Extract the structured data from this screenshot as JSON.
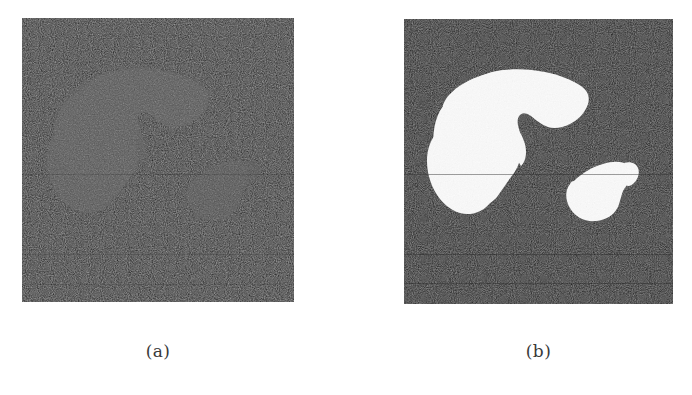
{
  "figure": {
    "background_color": "#ffffff",
    "panels": [
      {
        "id": "a",
        "caption": "(a)",
        "description": "CT abdominal slice with liver and spleen regions highlighted in mid-gray over a dark noisy background",
        "background_color": "#171717",
        "region_color": "#545454",
        "noise_intensity": "high",
        "regions": [
          {
            "name": "liver",
            "label": "liver-region",
            "fill": "#545454"
          },
          {
            "name": "spleen",
            "label": "spleen-region",
            "fill": "#4e4e4e"
          },
          {
            "name": "rib-sliver",
            "label": "rib-sliver-region",
            "fill": "#4a4a4a"
          }
        ]
      },
      {
        "id": "b",
        "caption": "(b)",
        "description": "Binary segmentation mask of the same slice: liver and spleen in white over black background",
        "background_color": "#0d0d0d",
        "region_color": "#fbfbfb",
        "noise_intensity": "high",
        "regions": [
          {
            "name": "liver",
            "label": "liver-region",
            "fill": "#fbfbfb"
          },
          {
            "name": "spleen",
            "label": "spleen-region",
            "fill": "#fbfbfb"
          },
          {
            "name": "rib-sliver",
            "label": "rib-sliver-region",
            "fill": "#fbfbfb"
          }
        ]
      }
    ]
  }
}
